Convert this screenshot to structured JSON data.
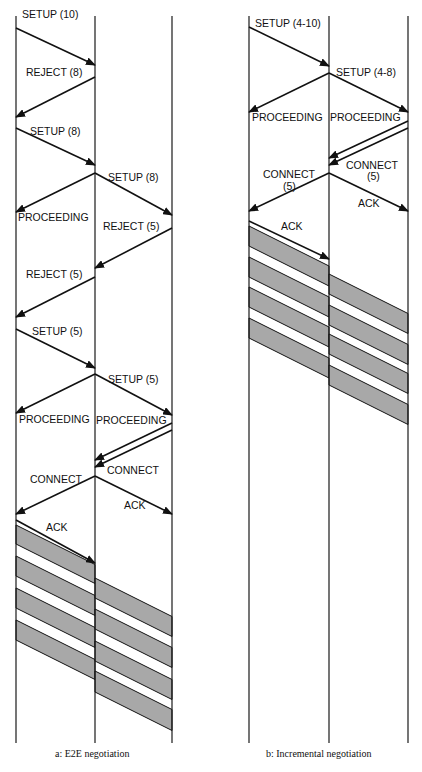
{
  "panels": [
    {
      "id": "a",
      "caption": "a:  E2E negotiation",
      "lifelines_x": [
        16,
        95,
        172
      ],
      "messages": [
        {
          "label": "SETUP (10)",
          "from": [
            16,
            28
          ],
          "to": [
            95,
            65
          ],
          "lx": 22,
          "ly": 18
        },
        {
          "label": "REJECT (8)",
          "from": [
            95,
            77
          ],
          "to": [
            16,
            117
          ],
          "lx": 26,
          "ly": 76
        },
        {
          "label": "SETUP (8)",
          "from": [
            16,
            128
          ],
          "to": [
            95,
            165
          ],
          "lx": 30,
          "ly": 135
        },
        {
          "label": "SETUP (8)",
          "from": [
            95,
            173
          ],
          "to": [
            172,
            215
          ],
          "lx": 108,
          "ly": 181
        },
        {
          "label": "PROCEEDING",
          "from": [
            95,
            173
          ],
          "to": [
            16,
            212
          ],
          "lx": 18,
          "ly": 221
        },
        {
          "label": "REJECT (5)",
          "from": [
            172,
            228
          ],
          "to": [
            95,
            268
          ],
          "lx": 103,
          "ly": 230
        },
        {
          "label": "REJECT (5)",
          "from": [
            95,
            277
          ],
          "to": [
            16,
            317
          ],
          "lx": 26,
          "ly": 278
        },
        {
          "label": "SETUP (5)",
          "from": [
            16,
            329
          ],
          "to": [
            95,
            368
          ],
          "lx": 32,
          "ly": 335
        },
        {
          "label": "SETUP (5)",
          "from": [
            95,
            374
          ],
          "to": [
            172,
            415
          ],
          "lx": 108,
          "ly": 383
        },
        {
          "label": "PROCEEDING",
          "from": [
            95,
            374
          ],
          "to": [
            16,
            413
          ],
          "lx": 19,
          "ly": 423
        },
        {
          "label": "PROCEEDING",
          "from": [
            172,
            423
          ],
          "to": [
            95,
            460
          ],
          "lx": 96,
          "ly": 424
        },
        {
          "label": "",
          "from": [
            172,
            430
          ],
          "to": [
            95,
            467
          ],
          "lx": 0,
          "ly": 0
        },
        {
          "label": "CONNECT",
          "from": [
            95,
            476
          ],
          "to": [
            16,
            514
          ],
          "lx": 30,
          "ly": 483
        },
        {
          "label": "CONNECT",
          "from": [
            95,
            476
          ],
          "to": [
            95,
            476
          ],
          "lx": 107,
          "ly": 474
        },
        {
          "label": "ACK",
          "from": [
            95,
            476
          ],
          "to": [
            172,
            514
          ],
          "lx": 124,
          "ly": 509
        },
        {
          "label": "ACK",
          "from": [
            16,
            520
          ],
          "to": [
            95,
            563
          ],
          "lx": 46,
          "ly": 531
        }
      ],
      "bands": [
        {
          "x1": 16,
          "x2": 95,
          "y": 525,
          "h": 19
        },
        {
          "x1": 16,
          "x2": 95,
          "y": 556,
          "h": 20
        },
        {
          "x1": 16,
          "x2": 95,
          "y": 588,
          "h": 20
        },
        {
          "x1": 16,
          "x2": 95,
          "y": 620,
          "h": 20
        },
        {
          "x1": 95,
          "x2": 172,
          "y": 578,
          "h": 20
        },
        {
          "x1": 95,
          "x2": 172,
          "y": 609,
          "h": 20
        },
        {
          "x1": 95,
          "x2": 172,
          "y": 641,
          "h": 20
        },
        {
          "x1": 95,
          "x2": 172,
          "y": 671,
          "h": 21
        }
      ]
    },
    {
      "id": "b",
      "caption": "b:  Incremental negotiation",
      "lifelines_x": [
        249,
        329,
        408
      ],
      "messages": [
        {
          "label": "SETUP (4-10)",
          "from": [
            249,
            27
          ],
          "to": [
            329,
            66
          ],
          "lx": 255,
          "ly": 27
        },
        {
          "label": "SETUP (4-8)",
          "from": [
            329,
            73
          ],
          "to": [
            408,
            112
          ],
          "lx": 336,
          "ly": 76
        },
        {
          "label": "PROCEEDING",
          "from": [
            329,
            73
          ],
          "to": [
            249,
            112
          ],
          "lx": 252,
          "ly": 121
        },
        {
          "label": "PROCEEDING",
          "from": [
            408,
            121
          ],
          "to": [
            329,
            158
          ],
          "lx": 330,
          "ly": 121
        },
        {
          "label": "",
          "from": [
            408,
            128
          ],
          "to": [
            329,
            165
          ],
          "lx": 0,
          "ly": 0
        },
        {
          "label": "CONNECT",
          "from": [
            329,
            173
          ],
          "to": [
            249,
            211
          ],
          "lx": 263,
          "ly": 178
        },
        {
          "label": "(5)",
          "from": [
            0,
            0
          ],
          "to": [
            0,
            0
          ],
          "lx": 283,
          "ly": 190
        },
        {
          "label": "CONNECT",
          "from": [
            0,
            0
          ],
          "to": [
            0,
            0
          ],
          "lx": 346,
          "ly": 169
        },
        {
          "label": "(5)",
          "from": [
            0,
            0
          ],
          "to": [
            0,
            0
          ],
          "lx": 367,
          "ly": 180
        },
        {
          "label": "ACK",
          "from": [
            329,
            173
          ],
          "to": [
            408,
            211
          ],
          "lx": 358,
          "ly": 207
        },
        {
          "label": "ACK",
          "from": [
            249,
            221
          ],
          "to": [
            329,
            259
          ],
          "lx": 281,
          "ly": 230
        }
      ],
      "bands": [
        {
          "x1": 249,
          "x2": 329,
          "y": 226,
          "h": 20
        },
        {
          "x1": 249,
          "x2": 329,
          "y": 257,
          "h": 20
        },
        {
          "x1": 249,
          "x2": 329,
          "y": 287,
          "h": 20
        },
        {
          "x1": 249,
          "x2": 329,
          "y": 318,
          "h": 20
        },
        {
          "x1": 329,
          "x2": 408,
          "y": 274,
          "h": 20
        },
        {
          "x1": 329,
          "x2": 408,
          "y": 305,
          "h": 20
        },
        {
          "x1": 329,
          "x2": 408,
          "y": 334,
          "h": 20
        },
        {
          "x1": 329,
          "x2": 408,
          "y": 365,
          "h": 20
        }
      ]
    }
  ],
  "lifeline_top": 16,
  "lifeline_bottom": 743,
  "caption_y": 757,
  "band_fill": "#a8a8a8",
  "line_color": "#1a1a1a"
}
